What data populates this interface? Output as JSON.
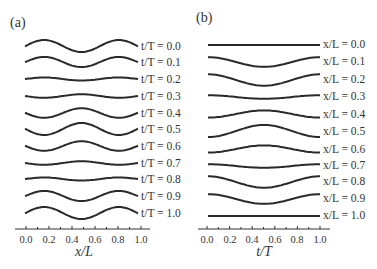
{
  "chart_data": [
    {
      "panel": "(a)",
      "type": "line",
      "title": "",
      "xlabel": "x/L",
      "ylabel": "",
      "xlim": [
        0.0,
        1.0
      ],
      "xticks": [
        "0.0",
        "0.2",
        "0.4",
        "0.6",
        "0.8",
        "1.0"
      ],
      "grid": false,
      "description": "Stacked waveform profiles along x/L at successive times t/T; shape ~ cos(2πx/L·... ) with peaks near x/L≈0.17 and 0.83, trough at 0.5",
      "series": [
        {
          "name": "t/T = 0.0",
          "amplitude": 1.0
        },
        {
          "name": "t/T = 0.1",
          "amplitude": 0.85
        },
        {
          "name": "t/T = 0.2",
          "amplitude": 0.25
        },
        {
          "name": "t/T = 0.3",
          "amplitude": -0.3
        },
        {
          "name": "t/T = 0.4",
          "amplitude": -0.8
        },
        {
          "name": "t/T = 0.5",
          "amplitude": -1.0
        },
        {
          "name": "t/T = 0.6",
          "amplitude": -0.8
        },
        {
          "name": "t/T = 0.7",
          "amplitude": -0.3
        },
        {
          "name": "t/T = 0.8",
          "amplitude": 0.25
        },
        {
          "name": "t/T = 0.9",
          "amplitude": 0.85
        },
        {
          "name": "t/T = 1.0",
          "amplitude": 1.0
        }
      ]
    },
    {
      "panel": "(b)",
      "type": "line",
      "title": "",
      "xlabel": "t/T",
      "ylabel": "",
      "xlim": [
        0.0,
        1.0
      ],
      "xticks": [
        "0.0",
        "0.2",
        "0.4",
        "0.6",
        "0.8",
        "1.0"
      ],
      "grid": false,
      "description": "Stacked time histories at fixed positions x/L; shape ~ cos(2πt/T) with trough/peak at t/T=0.5",
      "series": [
        {
          "name": "x/L = 0.0",
          "amplitude": 0.0
        },
        {
          "name": "x/L = 0.1",
          "amplitude": 0.8
        },
        {
          "name": "x/L = 0.2",
          "amplitude": 0.95
        },
        {
          "name": "x/L = 0.3",
          "amplitude": 0.3
        },
        {
          "name": "x/L = 0.4",
          "amplitude": -0.6
        },
        {
          "name": "x/L = 0.5",
          "amplitude": -1.0
        },
        {
          "name": "x/L = 0.6",
          "amplitude": -0.6
        },
        {
          "name": "x/L = 0.7",
          "amplitude": 0.3
        },
        {
          "name": "x/L = 0.8",
          "amplitude": 0.95
        },
        {
          "name": "x/L = 0.9",
          "amplitude": 0.8
        },
        {
          "name": "x/L = 1.0",
          "amplitude": 0.0
        }
      ]
    }
  ],
  "panels": {
    "a": {
      "tag": "(a)",
      "xlabel": "x/L",
      "ticks": [
        "0.0",
        "0.2",
        "0.4",
        "0.6",
        "0.8",
        "1.0"
      ],
      "labels": [
        "t/T = 0.0",
        "t/T = 0.1",
        "t/T = 0.2",
        "t/T = 0.3",
        "t/T = 0.4",
        "t/T = 0.5",
        "t/T = 0.6",
        "t/T = 0.7",
        "t/T = 0.8",
        "t/T = 0.9",
        "t/T = 1.0"
      ]
    },
    "b": {
      "tag": "(b)",
      "xlabel": "t/T",
      "ticks": [
        "0.0",
        "0.2",
        "0.4",
        "0.6",
        "0.8",
        "1.0"
      ],
      "labels": [
        "x/L = 0.0",
        "x/L = 0.1",
        "x/L = 0.2",
        "x/L = 0.3",
        "x/L = 0.4",
        "x/L = 0.5",
        "x/L = 0.6",
        "x/L = 0.7",
        "x/L = 0.8",
        "x/L = 0.9",
        "x/L = 1.0"
      ]
    }
  }
}
